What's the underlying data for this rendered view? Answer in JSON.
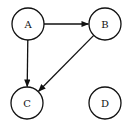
{
  "diagram": {
    "type": "directed-graph",
    "nodes": [
      {
        "id": "A",
        "label": "A",
        "cx": 28,
        "cy": 24,
        "r": 16
      },
      {
        "id": "B",
        "label": "B",
        "cx": 105,
        "cy": 24,
        "r": 16
      },
      {
        "id": "C",
        "label": "C",
        "cx": 27,
        "cy": 103,
        "r": 16
      },
      {
        "id": "D",
        "label": "D",
        "cx": 105,
        "cy": 103,
        "r": 16
      }
    ],
    "edges": [
      {
        "from": "A",
        "to": "B"
      },
      {
        "from": "A",
        "to": "C"
      },
      {
        "from": "B",
        "to": "C"
      }
    ],
    "colors": {
      "stroke": "#111111",
      "fill": "#ffffff"
    }
  }
}
